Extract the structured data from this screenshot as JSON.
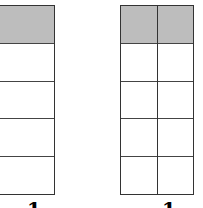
{
  "figures": [
    {
      "name": "left-fraction-bar",
      "columns": 1,
      "rows": 5,
      "shaded_rows": 1,
      "label": "1"
    },
    {
      "name": "right-fraction-bar",
      "columns": 2,
      "rows": 5,
      "shaded_rows": 1,
      "label": "1"
    }
  ],
  "colors": {
    "shade": "#bdbdbd",
    "line": "#333333"
  }
}
